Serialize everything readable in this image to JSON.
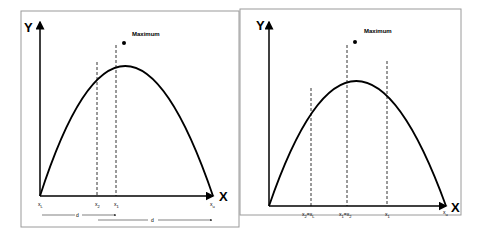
{
  "panels": [
    {
      "axis_y": "Y",
      "axis_x": "X",
      "maximum_label": "Maximum",
      "x_labels": [
        {
          "base": "x",
          "sub": "L"
        },
        {
          "base": "x",
          "sub": "2"
        },
        {
          "base": "x",
          "sub": "1"
        },
        {
          "base": "x",
          "sub": "u"
        }
      ],
      "distance_labels": [
        "d",
        "d"
      ]
    },
    {
      "axis_y": "Y",
      "axis_x": "X",
      "maximum_label": "Maximum",
      "x_labels": [
        {
          "base": "x",
          "sub": "2",
          "eq": "=x",
          "eqsub": "L"
        },
        {
          "base": "x",
          "sub": "1",
          "eq": "=x",
          "eqsub": "2"
        },
        {
          "base": "x",
          "sub": "1"
        },
        {
          "base": "x",
          "sub": "u"
        }
      ]
    }
  ],
  "colors": {
    "line": "#000000",
    "frame": "#9a9a9a"
  }
}
